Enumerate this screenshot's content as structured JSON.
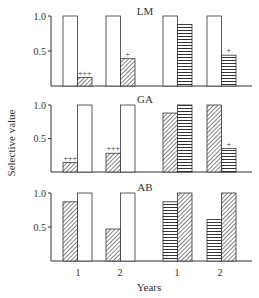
{
  "chart_data": {
    "type": "bar",
    "ylabel": "Selective value",
    "xlabel": "Years",
    "ylim": [
      0,
      1.0
    ],
    "yticks": [
      0.5,
      1.0
    ],
    "ytick_labels": [
      "0.5",
      "1.0"
    ],
    "grid": false,
    "x_groups": [
      "1",
      "2",
      "1",
      "2"
    ],
    "panels": [
      {
        "title": "LM",
        "groups": [
          {
            "year": "1",
            "bars": [
              {
                "pattern": "white",
                "value": 1.0,
                "annotation": ""
              },
              {
                "pattern": "diagonal",
                "value": 0.12,
                "annotation": "+++"
              }
            ]
          },
          {
            "year": "2",
            "bars": [
              {
                "pattern": "white",
                "value": 1.0,
                "annotation": ""
              },
              {
                "pattern": "diagonal",
                "value": 0.39,
                "annotation": "+"
              }
            ]
          },
          {
            "year": "1",
            "bars": [
              {
                "pattern": "white",
                "value": 1.0,
                "annotation": ""
              },
              {
                "pattern": "horizontal",
                "value": 0.88,
                "annotation": ""
              }
            ]
          },
          {
            "year": "2",
            "bars": [
              {
                "pattern": "white",
                "value": 1.0,
                "annotation": ""
              },
              {
                "pattern": "horizontal",
                "value": 0.44,
                "annotation": "+"
              }
            ]
          }
        ]
      },
      {
        "title": "GA",
        "groups": [
          {
            "year": "1",
            "bars": [
              {
                "pattern": "diagonal",
                "value": 0.14,
                "annotation": "+++"
              },
              {
                "pattern": "white",
                "value": 1.0,
                "annotation": ""
              }
            ]
          },
          {
            "year": "2",
            "bars": [
              {
                "pattern": "diagonal",
                "value": 0.28,
                "annotation": "+++"
              },
              {
                "pattern": "white",
                "value": 1.0,
                "annotation": ""
              }
            ]
          },
          {
            "year": "1",
            "bars": [
              {
                "pattern": "diagonal",
                "value": 0.88,
                "annotation": ""
              },
              {
                "pattern": "horizontal",
                "value": 1.0,
                "annotation": ""
              }
            ]
          },
          {
            "year": "2",
            "bars": [
              {
                "pattern": "diagonal",
                "value": 1.0,
                "annotation": ""
              },
              {
                "pattern": "horizontal",
                "value": 0.35,
                "annotation": "+"
              }
            ]
          }
        ]
      },
      {
        "title": "AB",
        "groups": [
          {
            "year": "1",
            "bars": [
              {
                "pattern": "diagonal",
                "value": 0.87,
                "annotation": ""
              },
              {
                "pattern": "white",
                "value": 1.0,
                "annotation": ""
              }
            ]
          },
          {
            "year": "2",
            "bars": [
              {
                "pattern": "diagonal",
                "value": 0.47,
                "annotation": ""
              },
              {
                "pattern": "white",
                "value": 1.0,
                "annotation": ""
              }
            ]
          },
          {
            "year": "1",
            "bars": [
              {
                "pattern": "horizontal",
                "value": 0.87,
                "annotation": ""
              },
              {
                "pattern": "diagonal",
                "value": 1.0,
                "annotation": ""
              }
            ]
          },
          {
            "year": "2",
            "bars": [
              {
                "pattern": "horizontal",
                "value": 0.61,
                "annotation": ""
              },
              {
                "pattern": "diagonal",
                "value": 1.0,
                "annotation": ""
              }
            ]
          }
        ]
      }
    ]
  },
  "colors": {
    "ink": "#333333",
    "bar_fill": "#ffffff"
  }
}
